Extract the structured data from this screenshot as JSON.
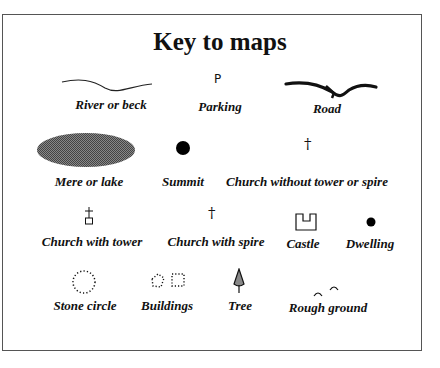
{
  "title": "Key to maps",
  "items": [
    {
      "label": "River or beck",
      "icon": "river-icon"
    },
    {
      "label": "Parking",
      "icon": "parking-icon",
      "glyph": "P"
    },
    {
      "label": "Road",
      "icon": "road-icon"
    },
    {
      "label": "Mere or lake",
      "icon": "lake-icon"
    },
    {
      "label": "Summit",
      "icon": "summit-icon"
    },
    {
      "label": "Church without tower or spire",
      "icon": "church-plain-icon",
      "glyph": "†"
    },
    {
      "label": "Church with tower",
      "icon": "church-tower-icon"
    },
    {
      "label": "Church with spire",
      "icon": "church-spire-icon",
      "glyph": "†"
    },
    {
      "label": "Castle",
      "icon": "castle-icon"
    },
    {
      "label": "Dwelling",
      "icon": "dwelling-icon"
    },
    {
      "label": "Stone circle",
      "icon": "stone-circle-icon"
    },
    {
      "label": "Buildings",
      "icon": "buildings-icon"
    },
    {
      "label": "Tree",
      "icon": "tree-icon"
    },
    {
      "label": "Rough ground",
      "icon": "rough-ground-icon"
    }
  ]
}
